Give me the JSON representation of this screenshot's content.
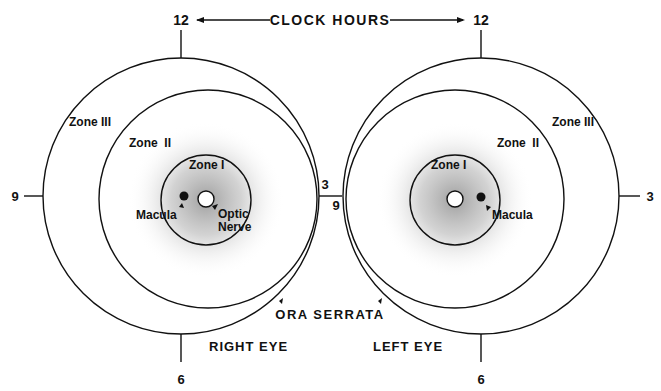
{
  "title": "CLOCK HOURS",
  "clock": {
    "top": "12",
    "bottom": "6",
    "left": "9",
    "right": "3"
  },
  "eyes": [
    {
      "label": "RIGHT EYE",
      "zones": [
        "Zone I",
        "Zone  II",
        "Zone III"
      ],
      "macula": "Macula",
      "optic": [
        "Optic",
        "Nerve"
      ]
    },
    {
      "label": "LEFT EYE",
      "zones": [
        "Zone I",
        "Zone  II",
        "Zone III"
      ],
      "macula": "Macula"
    }
  ],
  "ora_serrata": "ORA SERRATA",
  "colors": {
    "line": "#111111",
    "shade": "#9a9a9a",
    "bg": "#ffffff"
  }
}
